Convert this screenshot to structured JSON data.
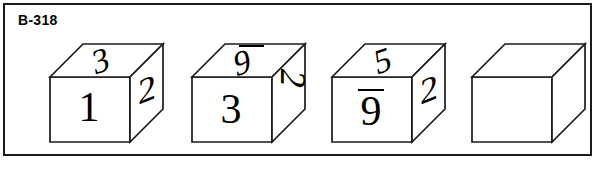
{
  "problem": {
    "label": "B-318"
  },
  "colors": {
    "frame_border": "#1a1a1a",
    "cube_edge": "#1a1a1a",
    "digit_ink": "#000000",
    "background": "#ffffff"
  },
  "puzzle": {
    "type": "cube-rotation-sequence",
    "cube_count": 4,
    "cubes": [
      {
        "index": 1,
        "blank": false,
        "faces": {
          "top": {
            "value": "3",
            "overline": false,
            "rotation_deg": 0
          },
          "front": {
            "value": "1",
            "overline": false,
            "rotation_deg": 0
          },
          "right": {
            "value": "2",
            "overline": false,
            "rotation_deg": 0
          }
        }
      },
      {
        "index": 2,
        "blank": false,
        "faces": {
          "top": {
            "value": "9",
            "overline": true,
            "rotation_deg": 0
          },
          "front": {
            "value": "3",
            "overline": false,
            "rotation_deg": 0
          },
          "right": {
            "value": "2",
            "overline": false,
            "rotation_deg": 90
          }
        }
      },
      {
        "index": 3,
        "blank": false,
        "faces": {
          "top": {
            "value": "5",
            "overline": false,
            "rotation_deg": 0
          },
          "front": {
            "value": "9",
            "overline": true,
            "rotation_deg": 0
          },
          "right": {
            "value": "2",
            "overline": false,
            "rotation_deg": 0
          }
        }
      },
      {
        "index": 4,
        "blank": true,
        "faces": {
          "top": {
            "value": "",
            "overline": false,
            "rotation_deg": 0
          },
          "front": {
            "value": "",
            "overline": false,
            "rotation_deg": 0
          },
          "right": {
            "value": "",
            "overline": false,
            "rotation_deg": 0
          }
        }
      }
    ]
  }
}
